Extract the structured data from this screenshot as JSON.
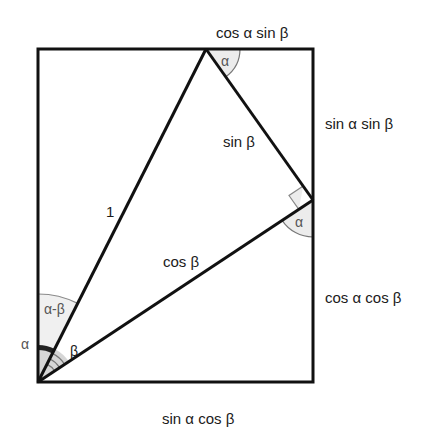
{
  "diagram": {
    "colors": {
      "stroke": "#111111",
      "arc_stroke": "#777777",
      "fill_light": "#f0f0f0",
      "fill_mid": "#d6d6d6",
      "fill_dark": "#222222",
      "text": "#1a1a1a",
      "angle_text": "#555555"
    },
    "edge_labels": {
      "top": "cos α sin β",
      "right_upper": "sin α sin β",
      "right_lower": "cos α cos β",
      "bottom": "sin α cos β"
    },
    "segment_labels": {
      "hypotenuse": "1",
      "opposite": "sin β",
      "adjacent": "cos β"
    },
    "angle_labels": {
      "top_vertex": "α",
      "right_vertex": "α",
      "origin_outer": "α",
      "origin_difference": "α-β",
      "origin_beta": "β"
    },
    "markers": {
      "right_angle_at": "right vertex between sin β and cos β"
    }
  }
}
